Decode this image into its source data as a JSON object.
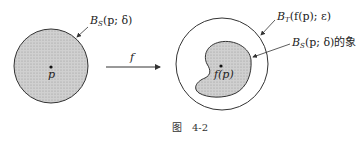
{
  "figure": {
    "caption_prefix": "图",
    "caption_number": "4-2"
  },
  "left": {
    "ball_label_main": "B",
    "ball_label_sub": "S",
    "ball_label_args": "(p; δ)",
    "point_label": "p"
  },
  "map": {
    "label": "f"
  },
  "right": {
    "outer_label_main": "B",
    "outer_label_sub": "T",
    "outer_label_args": "(f(p); ε)",
    "image_label_main": "B",
    "image_label_sub": "S",
    "image_label_args": "(p; δ)",
    "image_label_suffix": "的象",
    "point_label": "f(p)"
  },
  "colors": {
    "fill": "#c8c8c8",
    "stroke": "#333333"
  }
}
